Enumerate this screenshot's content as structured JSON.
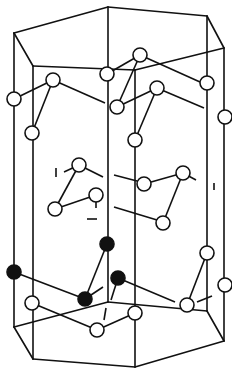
{
  "figure": {
    "colors": {
      "line": "#111111",
      "open_atom_fill": "#ffffff",
      "filled_atom_fill": "#111111",
      "background": "#ffffff"
    },
    "atom_radius": 7,
    "prism": {
      "top": [
        [
          14,
          33
        ],
        [
          108,
          7
        ],
        [
          207,
          16
        ],
        [
          224,
          48
        ],
        [
          135,
          70
        ],
        [
          33,
          66
        ]
      ],
      "bottom": [
        [
          14,
          327
        ],
        [
          108,
          302
        ],
        [
          207,
          311
        ],
        [
          224,
          341
        ],
        [
          135,
          367
        ],
        [
          33,
          359
        ]
      ]
    },
    "open_atoms": [
      [
        14,
        99
      ],
      [
        53,
        80
      ],
      [
        32,
        133
      ],
      [
        107,
        74
      ],
      [
        140,
        55
      ],
      [
        117,
        107
      ],
      [
        207,
        83
      ],
      [
        157,
        88
      ],
      [
        135,
        140
      ],
      [
        225,
        117
      ],
      [
        79,
        165
      ],
      [
        55,
        209
      ],
      [
        96,
        195
      ],
      [
        183,
        173
      ],
      [
        144,
        184
      ],
      [
        163,
        223
      ],
      [
        32,
        303
      ],
      [
        97,
        330
      ],
      [
        135,
        313
      ],
      [
        207,
        253
      ],
      [
        187,
        305
      ],
      [
        225,
        285
      ]
    ],
    "filled_atoms": [
      [
        107,
        244
      ],
      [
        14,
        272
      ],
      [
        85,
        299
      ],
      [
        118,
        278
      ]
    ],
    "bonds": [
      [
        [
          14,
          99
        ],
        [
          53,
          80
        ]
      ],
      [
        [
          53,
          80
        ],
        [
          32,
          133
        ]
      ],
      [
        [
          53,
          80
        ],
        [
          105,
          103
        ]
      ],
      [
        [
          107,
          74
        ],
        [
          140,
          55
        ]
      ],
      [
        [
          140,
          55
        ],
        [
          117,
          107
        ]
      ],
      [
        [
          140,
          55
        ],
        [
          200,
          82
        ]
      ],
      [
        [
          117,
          107
        ],
        [
          157,
          88
        ]
      ],
      [
        [
          157,
          88
        ],
        [
          135,
          140
        ]
      ],
      [
        [
          157,
          88
        ],
        [
          204,
          108
        ]
      ],
      [
        [
          79,
          165
        ],
        [
          55,
          209
        ]
      ],
      [
        [
          55,
          209
        ],
        [
          96,
          195
        ]
      ],
      [
        [
          79,
          165
        ],
        [
          103,
          177
        ]
      ],
      [
        [
          96,
          195
        ],
        [
          96,
          208
        ]
      ],
      [
        [
          183,
          173
        ],
        [
          163,
          223
        ]
      ],
      [
        [
          144,
          184
        ],
        [
          183,
          173
        ]
      ],
      [
        [
          114,
          175
        ],
        [
          137,
          181
        ]
      ],
      [
        [
          114,
          207
        ],
        [
          157,
          220
        ]
      ],
      [
        [
          79,
          165
        ],
        [
          64,
          172
        ]
      ],
      [
        [
          183,
          173
        ],
        [
          196,
          180
        ]
      ],
      [
        [
          107,
          244
        ],
        [
          85,
          299
        ]
      ],
      [
        [
          14,
          272
        ],
        [
          85,
          299
        ]
      ],
      [
        [
          85,
          299
        ],
        [
          103,
          287
        ]
      ],
      [
        [
          118,
          278
        ],
        [
          111,
          300
        ]
      ],
      [
        [
          118,
          278
        ],
        [
          175,
          302
        ]
      ],
      [
        [
          32,
          303
        ],
        [
          97,
          330
        ]
      ],
      [
        [
          97,
          330
        ],
        [
          135,
          313
        ]
      ],
      [
        [
          187,
          305
        ],
        [
          207,
          253
        ]
      ],
      [
        [
          197,
          302
        ],
        [
          212,
          296
        ]
      ],
      [
        [
          104,
          320
        ],
        [
          106,
          308
        ]
      ]
    ],
    "terminal_ticks": [
      [
        [
          56,
          168
        ],
        [
          56,
          177
        ]
      ],
      [
        [
          87,
          219
        ],
        [
          97,
          219
        ]
      ],
      [
        [
          214,
          183
        ],
        [
          214,
          190
        ]
      ]
    ]
  }
}
